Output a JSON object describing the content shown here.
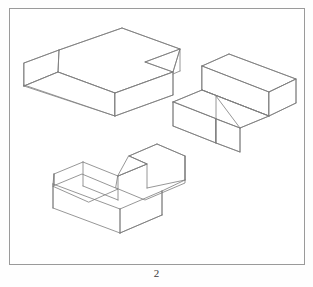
{
  "page": {
    "caption": "2",
    "frame": {
      "stroke": "#9a9a9a",
      "fill": "#ffffff"
    },
    "background": "#fefefe"
  },
  "drawing": {
    "title": "",
    "projection": "isometric",
    "line_color": "#7c7c7c",
    "line_width": 0.8,
    "face_fill": "#ffffff",
    "figures": [
      {
        "name": "upper-left-l-block",
        "label": "L-shaped block (upper left)",
        "description": "L-shaped rectangular prism shown in isometric view, tall end block at left joined to a long low arm extending to the lower right"
      },
      {
        "name": "right-t-block",
        "label": "T-shaped block (right)",
        "description": "T-shaped block in isometric view, long upper bar with a shorter leg projecting toward the viewer at the lower left"
      },
      {
        "name": "lower-u-block",
        "label": "U-shaped channel block (lower center)",
        "description": "U-shaped / notched channel block in isometric view with a rectangular slot cut into the top-left arm"
      }
    ]
  }
}
